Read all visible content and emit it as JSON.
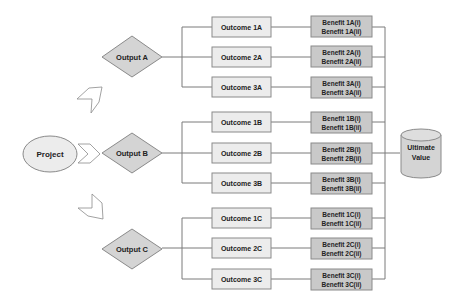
{
  "diagram": {
    "project": {
      "label": "Project"
    },
    "ultimate": {
      "line1": "Ultimate",
      "line2": "Value"
    },
    "outputs": [
      {
        "label": "Output A",
        "outcomes": [
          {
            "label": "Outcome 1A",
            "benefit_i": "Benefit 1A(i)",
            "benefit_ii": "Benefit 1A(ii)"
          },
          {
            "label": "Outcome 2A",
            "benefit_i": "Benefit 2A(i)",
            "benefit_ii": "Benefit 2A(ii)"
          },
          {
            "label": "Outcome 3A",
            "benefit_i": "Benefit 3A(i)",
            "benefit_ii": "Benefit 3A(ii)"
          }
        ]
      },
      {
        "label": "Output B",
        "outcomes": [
          {
            "label": "Outcome 1B",
            "benefit_i": "Benefit 1B(i)",
            "benefit_ii": "Benefit 1B(ii)"
          },
          {
            "label": "Outcome 2B",
            "benefit_i": "Benefit 2B(i)",
            "benefit_ii": "Benefit 2B(ii)"
          },
          {
            "label": "Outcome 3B",
            "benefit_i": "Benefit 3B(i)",
            "benefit_ii": "Benefit 3B(ii)"
          }
        ]
      },
      {
        "label": "Output C",
        "outcomes": [
          {
            "label": "Outcome 1C",
            "benefit_i": "Benefit 1C(i)",
            "benefit_ii": "Benefit 1C(ii)"
          },
          {
            "label": "Outcome 2C",
            "benefit_i": "Benefit 2C(i)",
            "benefit_ii": "Benefit 2C(ii)"
          },
          {
            "label": "Outcome 3C",
            "benefit_i": "Benefit 3C(i)",
            "benefit_ii": "Benefit 3C(ii)"
          }
        ]
      }
    ],
    "colors": {
      "line": "#7a7a7a",
      "outcome_fill": "#ececec",
      "benefit_fill": "#c9c9c9",
      "diamond_fill": "#d4d4d4",
      "ellipse_fill": "#ececec",
      "cylinder_fill": "#d4d4d4"
    }
  }
}
